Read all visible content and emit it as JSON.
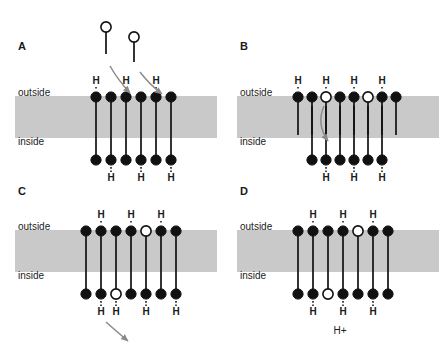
{
  "figure": {
    "width": 445,
    "height": 347,
    "background_color": "#ffffff",
    "membrane_color": "#c9c9c9",
    "stroke_color": "#111111",
    "arrow_color": "#8a8a8a"
  },
  "panels": [
    {
      "id": "A",
      "letter": "A",
      "origin_x": 10,
      "origin_y": 14,
      "outside_label": "outside",
      "inside_label": "inside",
      "membrane": {
        "x": 5,
        "y": 82,
        "width": 202,
        "height": 42
      },
      "label_outside_pos": {
        "x": 8,
        "y": 82
      },
      "label_inside_pos": {
        "x": 8,
        "y": 131
      },
      "letter_pos": {
        "x": 8,
        "y": 36
      },
      "lipid_span": true,
      "lipid_start_x": 86,
      "lipid_spacing": 15,
      "top_head_y": 83,
      "bottom_head_y": 146,
      "top_heads": [
        "filled",
        "filled",
        "filled",
        "filled",
        "filled",
        "filled"
      ],
      "bottom_heads": [
        "filled",
        "filled",
        "filled",
        "filled",
        "filled",
        "filled"
      ],
      "top_h_indices": [
        0,
        2,
        4
      ],
      "bottom_h_indices": [
        1,
        3,
        5
      ],
      "top_h_y": 70,
      "bottom_h_y": 167,
      "free_lipids": [
        {
          "head_x": 96,
          "head_y": 13,
          "tail_end_x": 96,
          "tail_end_y": 40
        },
        {
          "head_x": 124,
          "head_y": 23,
          "tail_end_x": 124,
          "tail_end_y": 48
        }
      ],
      "arrows": [
        {
          "x1": 100,
          "y1": 52,
          "cx": 108,
          "cy": 66,
          "x2": 120,
          "y2": 79
        },
        {
          "x1": 130,
          "y1": 58,
          "cx": 139,
          "cy": 70,
          "x2": 152,
          "y2": 80
        }
      ],
      "hplus": null
    },
    {
      "id": "B",
      "letter": "B",
      "origin_x": 232,
      "origin_y": 14,
      "outside_label": "outside",
      "inside_label": "inside",
      "membrane": {
        "x": 5,
        "y": 82,
        "width": 202,
        "height": 42
      },
      "label_outside_pos": {
        "x": 8,
        "y": 82
      },
      "label_inside_pos": {
        "x": 8,
        "y": 131
      },
      "letter_pos": {
        "x": 8,
        "y": 36
      },
      "lipid_span": false,
      "lipid_start_x": 66,
      "lipid_spacing": 14,
      "top_head_y": 83,
      "bottom_head_y": 146,
      "top_heads": [
        "filled",
        "filled",
        "open",
        "filled",
        "filled",
        "open",
        "filled",
        "filled"
      ],
      "bottom_heads": [
        "filled",
        "filled",
        "filled",
        "filled",
        "filled",
        "filled"
      ],
      "bottom_offset_x": 14,
      "top_h_indices": [
        0,
        2,
        4,
        6
      ],
      "bottom_h_indices": [
        1,
        3,
        5
      ],
      "top_h_y": 70,
      "bottom_h_y": 167,
      "free_lipids": [],
      "arrows": [
        {
          "x1": 92,
          "y1": 92,
          "cx": 84,
          "cy": 110,
          "x2": 96,
          "y2": 127
        }
      ],
      "hplus": null
    },
    {
      "id": "C",
      "letter": "C",
      "origin_x": 10,
      "origin_y": 186,
      "outside_label": "outside",
      "inside_label": "inside",
      "membrane": {
        "x": 5,
        "y": 44,
        "width": 202,
        "height": 42
      },
      "label_outside_pos": {
        "x": 8,
        "y": 44
      },
      "label_inside_pos": {
        "x": 8,
        "y": 93
      },
      "letter_pos": {
        "x": 8,
        "y": 9
      },
      "lipid_span": true,
      "lipid_start_x": 76,
      "lipid_spacing": 15,
      "top_head_y": 45,
      "bottom_head_y": 108,
      "top_heads": [
        "filled",
        "filled",
        "filled",
        "filled",
        "open",
        "filled",
        "filled"
      ],
      "bottom_heads": [
        "filled",
        "filled",
        "open",
        "filled",
        "filled",
        "filled",
        "filled"
      ],
      "top_h_indices": [
        1,
        3,
        5
      ],
      "bottom_h_indices": [
        1,
        2,
        4,
        6
      ],
      "top_h_y": 32,
      "bottom_h_y": 129,
      "free_lipids": [],
      "arrows": [
        {
          "x1": 96,
          "y1": 136,
          "cx": 106,
          "cy": 145,
          "x2": 118,
          "y2": 155
        }
      ],
      "hplus": null
    },
    {
      "id": "D",
      "letter": "D",
      "origin_x": 232,
      "origin_y": 186,
      "outside_label": "outside",
      "inside_label": "inside",
      "membrane": {
        "x": 5,
        "y": 44,
        "width": 202,
        "height": 42
      },
      "label_outside_pos": {
        "x": 8,
        "y": 44
      },
      "label_inside_pos": {
        "x": 8,
        "y": 93
      },
      "letter_pos": {
        "x": 8,
        "y": 9
      },
      "lipid_span": true,
      "lipid_start_x": 66,
      "lipid_spacing": 15,
      "top_head_y": 45,
      "bottom_head_y": 108,
      "top_heads": [
        "filled",
        "filled",
        "filled",
        "filled",
        "open",
        "filled",
        "filled"
      ],
      "bottom_heads": [
        "filled",
        "filled",
        "open",
        "filled",
        "filled",
        "filled",
        "filled"
      ],
      "top_h_indices": [
        1,
        3,
        5
      ],
      "bottom_h_indices": [
        1,
        3,
        5
      ],
      "top_h_y": 32,
      "bottom_h_y": 129,
      "free_lipids": [],
      "arrows": [],
      "hplus": {
        "text": "H+",
        "x": 108,
        "y": 148
      }
    }
  ],
  "legend": {
    "head_filled_meaning": "protonated-head",
    "head_open_meaning": "deprotonated-head",
    "h_label": "H",
    "hplus_label": "H+"
  }
}
